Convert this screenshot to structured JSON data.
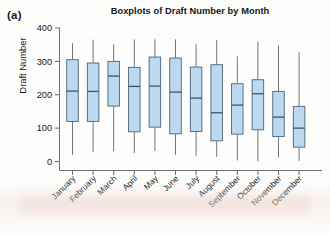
{
  "panel": {
    "label": "(a)"
  },
  "chart_data": {
    "type": "box",
    "title": "Boxplots of Draft Number by Month",
    "xlabel": "",
    "ylabel": "Draft Number",
    "ylim": [
      0,
      400
    ],
    "yticks": [
      0,
      100,
      200,
      300,
      400
    ],
    "ytick_labels": [
      "0",
      "100",
      "200",
      "300",
      "400"
    ],
    "grid": false,
    "legend": null,
    "categories": [
      "January",
      "February",
      "March",
      "April",
      "May",
      "June",
      "July",
      "August",
      "September",
      "October",
      "November",
      "December"
    ],
    "boxes": [
      {
        "category": "January",
        "whisker_low": 20,
        "q1": 120,
        "median": 211,
        "q3": 305,
        "whisker_high": 355
      },
      {
        "category": "February",
        "whisker_low": 29,
        "q1": 120,
        "median": 210,
        "q3": 295,
        "whisker_high": 365
      },
      {
        "category": "March",
        "whisker_low": 31,
        "q1": 166,
        "median": 256,
        "q3": 300,
        "whisker_high": 352
      },
      {
        "category": "April",
        "whisker_low": 25,
        "q1": 89,
        "median": 225,
        "q3": 282,
        "whisker_high": 366
      },
      {
        "category": "May",
        "whisker_low": 31,
        "q1": 103,
        "median": 226,
        "q3": 313,
        "whisker_high": 366
      },
      {
        "category": "June",
        "whisker_low": 20,
        "q1": 83,
        "median": 208,
        "q3": 310,
        "whisker_high": 366
      },
      {
        "category": "July",
        "whisker_low": 16,
        "q1": 90,
        "median": 190,
        "q3": 283,
        "whisker_high": 352
      },
      {
        "category": "August",
        "whisker_low": 14,
        "q1": 62,
        "median": 146,
        "q3": 290,
        "whisker_high": 364
      },
      {
        "category": "September",
        "whisker_low": 3,
        "q1": 82,
        "median": 169,
        "q3": 233,
        "whisker_high": 315
      },
      {
        "category": "October",
        "whisker_low": 1,
        "q1": 95,
        "median": 203,
        "q3": 245,
        "whisker_high": 359
      },
      {
        "category": "November",
        "whisker_low": 12,
        "q1": 75,
        "median": 133,
        "q3": 210,
        "whisker_high": 348
      },
      {
        "category": "December",
        "whisker_low": 2,
        "q1": 43,
        "median": 100,
        "q3": 165,
        "whisker_high": 328
      }
    ],
    "colors": {
      "box_fill": "#bcd9ef",
      "box_edge": "#4d6b85",
      "median": "#3b566d",
      "whisker": "#767676",
      "axis": "#6f6f6f",
      "text": "#161616",
      "background": "#fdfdfc"
    }
  }
}
